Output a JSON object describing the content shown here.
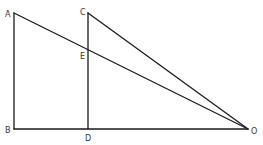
{
  "diagram": {
    "type": "geometry",
    "points": [
      {
        "id": "A",
        "label": "A",
        "x": 14,
        "y": 13,
        "lx": 5,
        "ly": 17
      },
      {
        "id": "B",
        "label": "B",
        "x": 14,
        "y": 129,
        "lx": 5,
        "ly": 133
      },
      {
        "id": "C",
        "label": "C",
        "x": 88,
        "y": 13,
        "lx": 80,
        "ly": 15
      },
      {
        "id": "D",
        "label": "D",
        "x": 88,
        "y": 129,
        "lx": 85,
        "ly": 141
      },
      {
        "id": "E",
        "label": "E",
        "x": 88,
        "y": 50,
        "lx": 80,
        "ly": 59
      },
      {
        "id": "O",
        "label": "O",
        "x": 248,
        "y": 129,
        "lx": 251,
        "ly": 134
      }
    ],
    "segments": [
      {
        "from": "A",
        "to": "B"
      },
      {
        "from": "B",
        "to": "O"
      },
      {
        "from": "A",
        "to": "O"
      },
      {
        "from": "C",
        "to": "D"
      },
      {
        "from": "C",
        "to": "O"
      }
    ],
    "colors": {
      "stroke": "#1a1a1a",
      "label": "#333333",
      "background": "#ffffff"
    }
  }
}
